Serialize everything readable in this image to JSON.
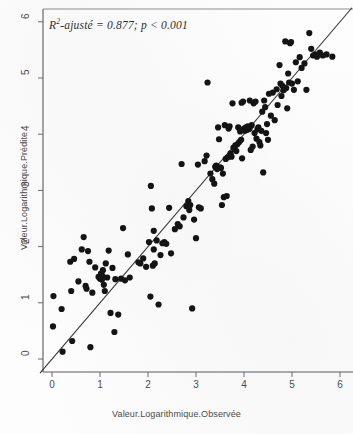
{
  "chart_data": {
    "type": "scatter",
    "title": "",
    "subtitle": "",
    "xlabel": "Valeur.Logarithmique.Observée",
    "ylabel": "Valeur.Logarithmique.Prédite",
    "xlim": [
      -0.25,
      6.25
    ],
    "ylim": [
      -0.45,
      6.35
    ],
    "xticks": [
      0,
      1,
      2,
      3,
      4,
      5,
      6
    ],
    "yticks": [
      0,
      1,
      2,
      3,
      4,
      5,
      6
    ],
    "xtick_labels": [
      "0",
      "1",
      "2",
      "3",
      "4",
      "5",
      "6"
    ],
    "ytick_labels": [
      "0",
      "1",
      "2",
      "3",
      "4",
      "5",
      "6"
    ],
    "grid": false,
    "legend": null,
    "point_color": "#141414",
    "point_size": 3.1,
    "line_color": "#3a3a3a",
    "reference_line": {
      "type": "identity",
      "slope": 1,
      "intercept": 0,
      "x_start": -0.25,
      "x_end": 6.25
    },
    "annotations": [
      {
        "text_prefix": "R",
        "text_superscript": "2",
        "text_suffix": "-ajusté = 0.877; p < 0.001",
        "x": 0.15,
        "y": 6.0
      }
    ],
    "statistics": {
      "r_squared_adjusted": 0.877,
      "p_value_label": "p < 0.001"
    },
    "points": [
      [
        0.02,
        0.58
      ],
      [
        0.03,
        1.12
      ],
      [
        0.2,
        0.89
      ],
      [
        0.22,
        0.13
      ],
      [
        0.38,
        1.73
      ],
      [
        0.4,
        1.21
      ],
      [
        0.42,
        0.32
      ],
      [
        0.55,
        1.38
      ],
      [
        0.62,
        1.95
      ],
      [
        0.66,
        2.17
      ],
      [
        0.7,
        1.3
      ],
      [
        0.72,
        1.25
      ],
      [
        0.78,
        1.73
      ],
      [
        0.8,
        0.21
      ],
      [
        0.84,
        1.18
      ],
      [
        0.9,
        1.63
      ],
      [
        0.97,
        1.46
      ],
      [
        1.0,
        1.43
      ],
      [
        1.02,
        1.52
      ],
      [
        1.04,
        1.41
      ],
      [
        1.05,
        1.48
      ],
      [
        1.06,
        1.58
      ],
      [
        1.08,
        1.32
      ],
      [
        1.1,
        1.21
      ],
      [
        1.12,
        1.7
      ],
      [
        1.18,
        1.93
      ],
      [
        1.22,
        0.82
      ],
      [
        1.26,
        1.62
      ],
      [
        1.3,
        0.48
      ],
      [
        1.32,
        1.42
      ],
      [
        1.38,
        0.79
      ],
      [
        1.44,
        1.43
      ],
      [
        1.48,
        2.33
      ],
      [
        1.52,
        1.4
      ],
      [
        1.58,
        1.86
      ],
      [
        1.62,
        1.45
      ],
      [
        1.8,
        1.72
      ],
      [
        1.84,
        1.7
      ],
      [
        1.9,
        1.79
      ],
      [
        1.96,
        1.64
      ],
      [
        2.02,
        2.08
      ],
      [
        2.05,
        1.11
      ],
      [
        2.06,
        3.08
      ],
      [
        2.08,
        2.68
      ],
      [
        2.1,
        1.66
      ],
      [
        2.12,
        2.28
      ],
      [
        2.14,
        1.7
      ],
      [
        2.18,
        2.11
      ],
      [
        2.22,
        0.97
      ],
      [
        2.26,
        1.85
      ],
      [
        2.3,
        2.06
      ],
      [
        2.34,
        2.08
      ],
      [
        2.38,
        2.05
      ],
      [
        2.44,
        2.69
      ],
      [
        2.48,
        1.88
      ],
      [
        2.56,
        2.31
      ],
      [
        2.62,
        2.4
      ],
      [
        2.66,
        2.36
      ],
      [
        2.7,
        3.47
      ],
      [
        2.74,
        2.52
      ],
      [
        2.8,
        2.72
      ],
      [
        2.84,
        2.81
      ],
      [
        2.86,
        2.65
      ],
      [
        2.88,
        2.74
      ],
      [
        2.92,
        0.9
      ],
      [
        2.96,
        2.48
      ],
      [
        3.0,
        2.15
      ],
      [
        3.04,
        3.46
      ],
      [
        3.06,
        2.7
      ],
      [
        3.1,
        2.68
      ],
      [
        3.18,
        3.52
      ],
      [
        3.22,
        3.62
      ],
      [
        3.24,
        4.92
      ],
      [
        3.3,
        3.3
      ],
      [
        3.34,
        3.2
      ],
      [
        3.38,
        3.12
      ],
      [
        3.4,
        3.42
      ],
      [
        3.42,
        3.44
      ],
      [
        3.44,
        3.38
      ],
      [
        3.46,
        4.12
      ],
      [
        3.48,
        3.91
      ],
      [
        3.5,
        3.41
      ],
      [
        3.52,
        3.4
      ],
      [
        3.54,
        2.74
      ],
      [
        3.56,
        3.3
      ],
      [
        3.58,
        2.88
      ],
      [
        3.6,
        4.16
      ],
      [
        3.62,
        3.56
      ],
      [
        3.64,
        2.9
      ],
      [
        3.66,
        3.59
      ],
      [
        3.7,
        4.14
      ],
      [
        3.72,
        3.66
      ],
      [
        3.74,
        3.6
      ],
      [
        3.76,
        4.55
      ],
      [
        3.78,
        3.76
      ],
      [
        3.8,
        3.74
      ],
      [
        3.82,
        3.8
      ],
      [
        3.84,
        3.7
      ],
      [
        3.86,
        3.82
      ],
      [
        3.88,
        4.12
      ],
      [
        3.9,
        3.86
      ],
      [
        3.92,
        4.05
      ],
      [
        3.94,
        3.9
      ],
      [
        3.96,
        3.57
      ],
      [
        3.98,
        4.58
      ],
      [
        4.0,
        4.1
      ],
      [
        4.02,
        4.06
      ],
      [
        4.04,
        4.12
      ],
      [
        4.06,
        4.08
      ],
      [
        4.08,
        4.14
      ],
      [
        4.1,
        4.09
      ],
      [
        4.12,
        4.11
      ],
      [
        4.14,
        3.72
      ],
      [
        4.16,
        4.16
      ],
      [
        4.18,
        3.78
      ],
      [
        4.2,
        4.55
      ],
      [
        4.22,
        4.02
      ],
      [
        4.24,
        4.58
      ],
      [
        4.26,
        3.92
      ],
      [
        4.28,
        4.09
      ],
      [
        4.3,
        4.12
      ],
      [
        4.32,
        3.86
      ],
      [
        4.34,
        3.8
      ],
      [
        4.36,
        4.06
      ],
      [
        4.38,
        4.4
      ],
      [
        4.4,
        3.32
      ],
      [
        4.44,
        4.48
      ],
      [
        4.48,
        4.18
      ],
      [
        4.52,
        4.72
      ],
      [
        4.56,
        4.33
      ],
      [
        4.6,
        4.74
      ],
      [
        4.64,
        4.25
      ],
      [
        4.68,
        4.8
      ],
      [
        4.7,
        4.52
      ],
      [
        4.74,
        5.23
      ],
      [
        4.76,
        4.9
      ],
      [
        4.78,
        4.68
      ],
      [
        4.8,
        4.86
      ],
      [
        4.82,
        4.78
      ],
      [
        4.84,
        4.8
      ],
      [
        4.86,
        5.65
      ],
      [
        4.88,
        4.82
      ],
      [
        4.9,
        4.46
      ],
      [
        4.92,
        5.08
      ],
      [
        4.94,
        4.92
      ],
      [
        4.96,
        5.62
      ],
      [
        4.98,
        5.64
      ],
      [
        5.0,
        4.9
      ],
      [
        5.04,
        4.79
      ],
      [
        5.08,
        5.28
      ],
      [
        5.12,
        4.94
      ],
      [
        5.16,
        5.37
      ],
      [
        5.2,
        5.18
      ],
      [
        5.26,
        5.26
      ],
      [
        5.3,
        4.79
      ],
      [
        5.36,
        5.8
      ],
      [
        5.4,
        5.52
      ],
      [
        5.44,
        5.4
      ],
      [
        5.48,
        5.42
      ],
      [
        5.52,
        5.38
      ],
      [
        5.58,
        5.45
      ],
      [
        5.64,
        5.4
      ],
      [
        5.72,
        5.42
      ],
      [
        5.84,
        5.38
      ],
      [
        4.42,
        4.6
      ],
      [
        4.12,
        4.6
      ],
      [
        3.95,
        4.56
      ],
      [
        4.46,
        4.02
      ],
      [
        4.5,
        3.9
      ],
      [
        3.68,
        4.1
      ],
      [
        2.12,
        1.95
      ],
      [
        1.15,
        1.45
      ],
      [
        0.75,
        1.92
      ],
      [
        0.46,
        1.78
      ]
    ]
  },
  "figure": {
    "width": 353,
    "height": 434,
    "background": "#fdfdfd"
  }
}
